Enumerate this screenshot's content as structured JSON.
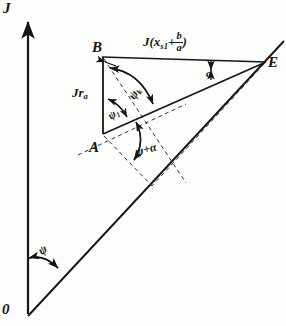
{
  "figure": {
    "type": "phasor-vector-diagram",
    "background_color": "#fdfdfc",
    "ink_color": "#161616"
  },
  "axis": {
    "vertical_label": "J",
    "origin_label": "0"
  },
  "vertices": {
    "b_label": "B",
    "a_label": "A",
    "e_label": "E"
  },
  "magnitudes": {
    "left_side": {
      "prefix": "Jr",
      "sub": "a"
    },
    "top_side": {
      "prefix": "J(x",
      "sub": "s1",
      "plus": "+",
      "frac_num": "b",
      "frac_den": "a",
      "close": ")"
    }
  },
  "angles": {
    "psi_origin": "ψ",
    "psi_k": {
      "base": "ψ",
      "sub": "k"
    },
    "psi_1": {
      "base": "ψ",
      "sub": "1"
    },
    "psi_plus_alpha": "ψ+α",
    "alpha_at_e": "α"
  },
  "geometry": {
    "origin": [
      28,
      314
    ],
    "axis_top": [
      28,
      18
    ],
    "point_a": [
      103,
      133
    ],
    "point_b": [
      103,
      57
    ],
    "point_e": [
      265,
      62
    ],
    "ray_end": [
      283,
      42
    ]
  }
}
